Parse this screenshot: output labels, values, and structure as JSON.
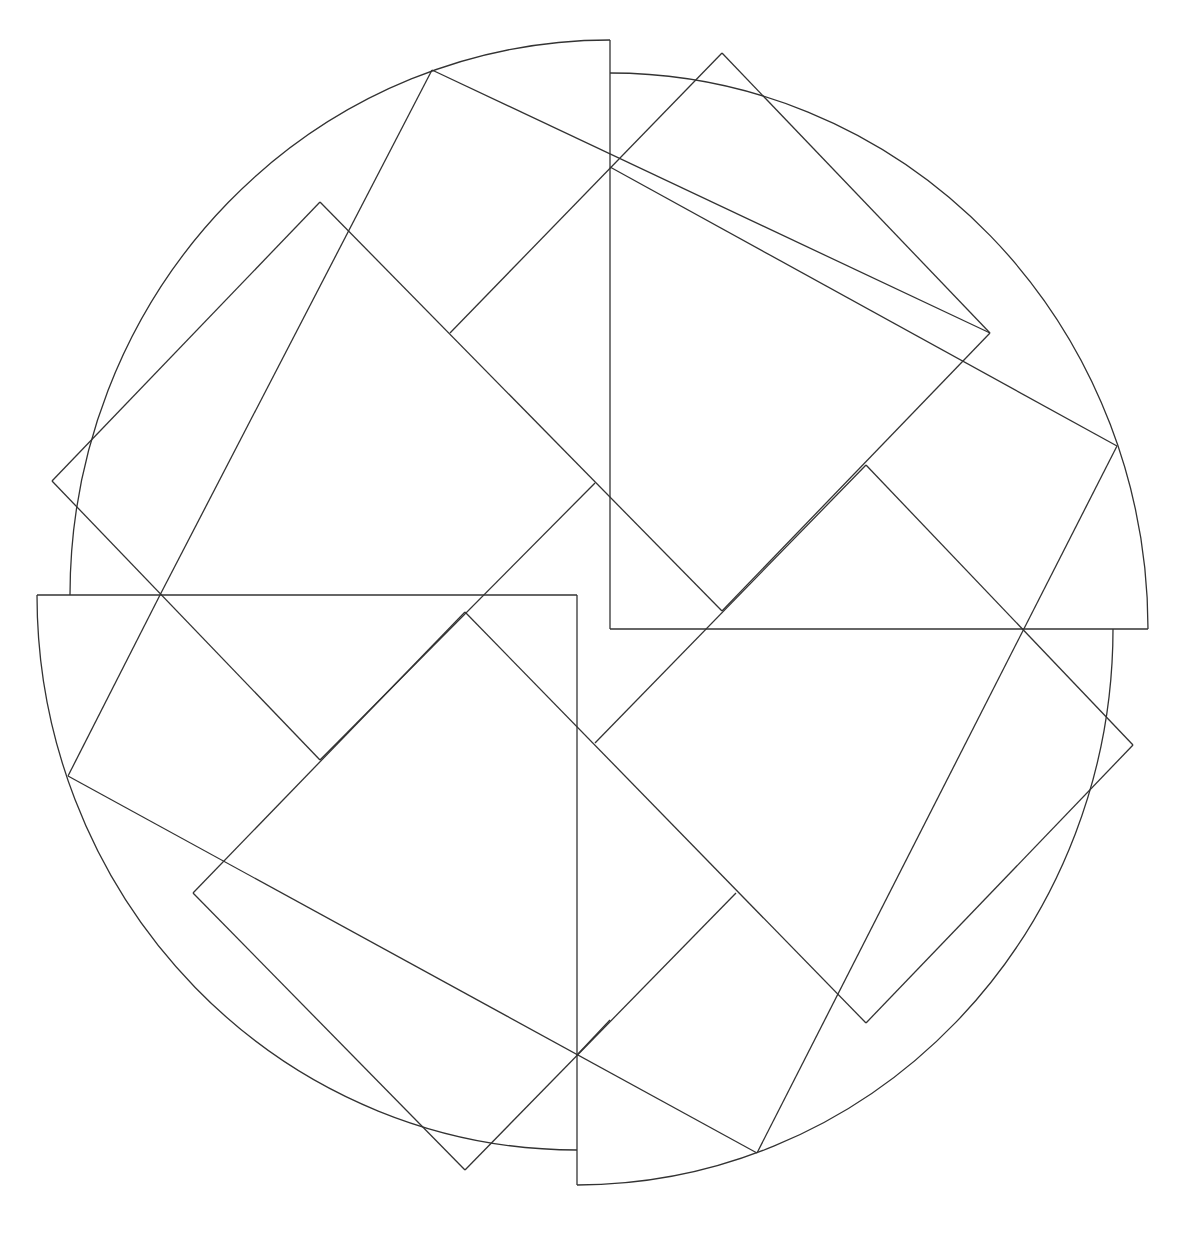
{
  "figure": {
    "stroke_color": "#333333",
    "background": "#ffffff",
    "arcs": [
      {
        "name": "top-left",
        "d": "M 70 595 A 540 555 0 0 1 610 40"
      },
      {
        "name": "top-right",
        "d": "M 610 73 A 538 556 0 0 1 1148 629"
      },
      {
        "name": "bottom-right",
        "d": "M 1113 629 A 536 556 0 0 1 577 1185"
      },
      {
        "name": "bottom-left",
        "d": "M 577 1150 A 540 555 0 0 1 37 595"
      }
    ],
    "lines": [
      [
        610,
        40,
        610,
        629
      ],
      [
        610,
        629,
        1148,
        629
      ],
      [
        37,
        595,
        577,
        595
      ],
      [
        577,
        595,
        577,
        1185
      ],
      [
        432,
        70,
        160,
        595
      ],
      [
        432,
        70,
        990,
        333
      ],
      [
        990,
        333,
        722,
        611
      ],
      [
        320,
        202,
        722,
        611
      ],
      [
        320,
        202,
        52,
        481
      ],
      [
        52,
        481,
        320,
        760
      ],
      [
        160,
        595,
        68,
        776
      ],
      [
        68,
        776,
        757,
        1153
      ],
      [
        757,
        1153,
        1117,
        446
      ],
      [
        1117,
        446,
        610,
        167
      ],
      [
        722,
        53,
        450,
        333
      ],
      [
        722,
        53,
        990,
        333
      ],
      [
        1133,
        745,
        866,
        1023
      ],
      [
        866,
        1023,
        465,
        612
      ],
      [
        465,
        612,
        193,
        893
      ],
      [
        193,
        893,
        465,
        1170
      ],
      [
        465,
        1170,
        736,
        893
      ],
      [
        866,
        465,
        1133,
        745
      ],
      [
        866,
        465,
        595,
        743
      ],
      [
        577,
        1055,
        610,
        1020
      ],
      [
        320,
        760,
        595,
        483
      ]
    ]
  }
}
